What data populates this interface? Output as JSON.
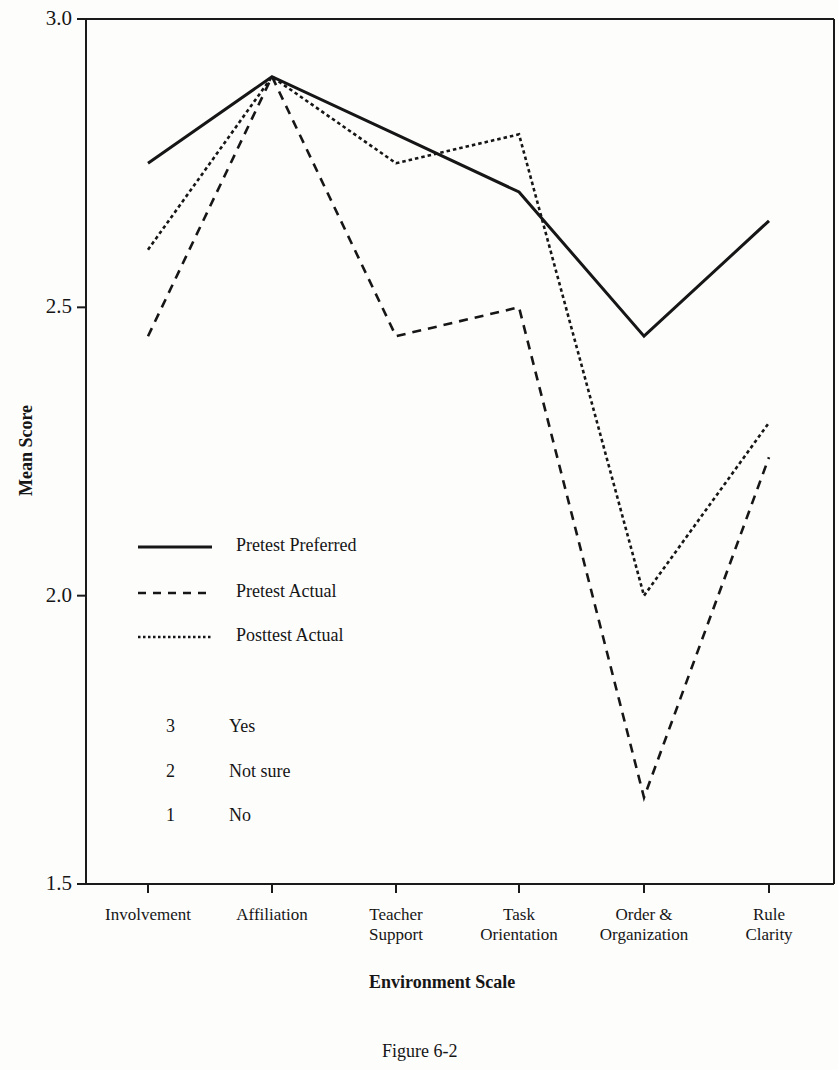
{
  "chart_data": {
    "type": "line",
    "title": "",
    "caption": "Figure 6-2",
    "xlabel": "Environment Scale",
    "ylabel": "Mean Score",
    "ylim": [
      1.5,
      3.0
    ],
    "yticks": [
      "3.0",
      "2.5",
      "2.0",
      "1.5"
    ],
    "grid": false,
    "legend_position": "inside-left",
    "categories": [
      [
        "Involvement"
      ],
      [
        "Affiliation"
      ],
      [
        "Teacher",
        "Support"
      ],
      [
        "Task",
        "Orientation"
      ],
      [
        "Order &",
        "Organization"
      ],
      [
        "Rule",
        "Clarity"
      ]
    ],
    "category_names": [
      "Involvement",
      "Affiliation",
      "Teacher Support",
      "Task Orientation",
      "Order & Organization",
      "Rule Clarity"
    ],
    "series": [
      {
        "name": "Pretest Preferred",
        "style": "solid",
        "values": [
          2.75,
          2.9,
          2.8,
          2.7,
          2.45,
          2.65
        ]
      },
      {
        "name": "Pretest Actual",
        "style": "dashed",
        "values": [
          2.45,
          2.9,
          2.45,
          2.5,
          1.65,
          2.24
        ]
      },
      {
        "name": "Posttest Actual",
        "style": "dotted",
        "values": [
          2.6,
          2.9,
          2.75,
          2.8,
          2.0,
          2.3
        ]
      }
    ],
    "scale_key": [
      {
        "value": "3",
        "label": "Yes"
      },
      {
        "value": "2",
        "label": "Not sure"
      },
      {
        "value": "1",
        "label": "No"
      }
    ]
  }
}
